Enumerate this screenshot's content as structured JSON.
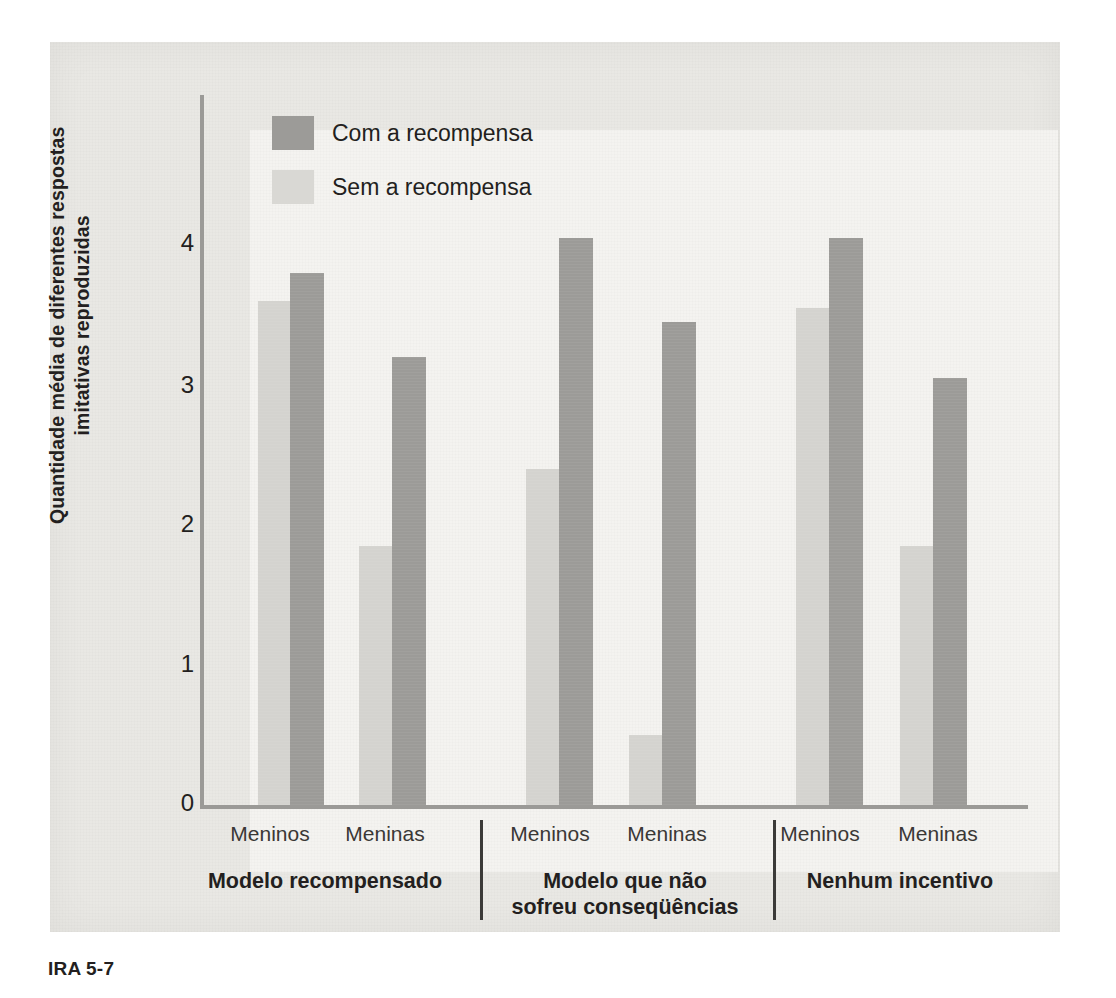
{
  "figure": {
    "caption": "IRA 5-7"
  },
  "legend": {
    "position": "inside-top-left",
    "items": [
      {
        "label": "Com a recompensa",
        "color": "#9c9b98",
        "key": "com"
      },
      {
        "label": "Sem a recompensa",
        "color": "#d9d8d4",
        "key": "sem"
      }
    ]
  },
  "axes": {
    "ylabel_line1": "Quantidade média de diferentes respostas",
    "ylabel_line2": "imitativas reproduzidas",
    "yticks": [
      "0",
      "1",
      "2",
      "3",
      "4"
    ],
    "ylim": [
      0,
      4.6
    ]
  },
  "groups": [
    {
      "caption_line1": "Modelo recompensado",
      "caption_line2": "",
      "genders": [
        "Meninos",
        "Meninas"
      ]
    },
    {
      "caption_line1": "Modelo que não",
      "caption_line2": "sofreu conseqüências",
      "genders": [
        "Meninos",
        "Meninas"
      ]
    },
    {
      "caption_line1": "Nenhum incentivo",
      "caption_line2": "",
      "genders": [
        "Meninos",
        "Meninas"
      ]
    }
  ],
  "chart_data": {
    "type": "bar",
    "title": "",
    "xlabel": "",
    "ylabel": "Quantidade média de diferentes respostas imitativas reproduzidas",
    "ylim": [
      0,
      4.6
    ],
    "yticks": [
      0,
      1,
      2,
      3,
      4
    ],
    "grid": false,
    "legend_position": "top-left inside plot",
    "categories": [
      "Modelo recompensado — Meninos",
      "Modelo recompensado — Meninas",
      "Modelo que não sofreu conseqüências — Meninos",
      "Modelo que não sofreu conseqüências — Meninas",
      "Nenhum incentivo — Meninos",
      "Nenhum incentivo — Meninas"
    ],
    "series": [
      {
        "name": "Sem a recompensa",
        "color": "#d9d8d4",
        "values": [
          3.6,
          1.85,
          2.4,
          0.5,
          3.55,
          1.85
        ]
      },
      {
        "name": "Com a recompensa",
        "color": "#9c9b98",
        "values": [
          3.8,
          3.2,
          4.05,
          3.45,
          4.05,
          3.05
        ]
      }
    ],
    "bars": [
      {
        "group": 0,
        "gender": "Meninos",
        "series": "Sem a recompensa",
        "value": 3.6
      },
      {
        "group": 0,
        "gender": "Meninos",
        "series": "Com a recompensa",
        "value": 3.8
      },
      {
        "group": 0,
        "gender": "Meninas",
        "series": "Sem a recompensa",
        "value": 1.85
      },
      {
        "group": 0,
        "gender": "Meninas",
        "series": "Com a recompensa",
        "value": 3.2
      },
      {
        "group": 1,
        "gender": "Meninos",
        "series": "Sem a recompensa",
        "value": 2.4
      },
      {
        "group": 1,
        "gender": "Meninos",
        "series": "Com a recompensa",
        "value": 4.05
      },
      {
        "group": 1,
        "gender": "Meninas",
        "series": "Sem a recompensa",
        "value": 0.5
      },
      {
        "group": 1,
        "gender": "Meninas",
        "series": "Com a recompensa",
        "value": 3.45
      },
      {
        "group": 2,
        "gender": "Meninos",
        "series": "Sem a recompensa",
        "value": 3.55
      },
      {
        "group": 2,
        "gender": "Meninos",
        "series": "Com a recompensa",
        "value": 4.05
      },
      {
        "group": 2,
        "gender": "Meninas",
        "series": "Sem a recompensa",
        "value": 1.85
      },
      {
        "group": 2,
        "gender": "Meninas",
        "series": "Com a recompensa",
        "value": 3.05
      }
    ]
  }
}
